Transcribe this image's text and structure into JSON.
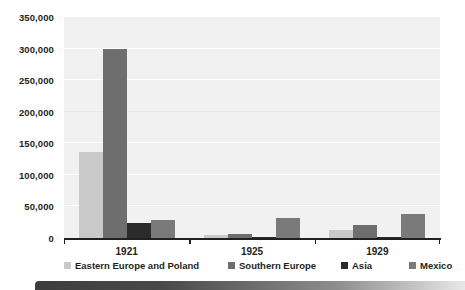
{
  "chart_data": {
    "type": "bar",
    "title": "",
    "subtitle": "",
    "xlabel": "",
    "ylabel": "",
    "categories": [
      "1921",
      "1925",
      "1929"
    ],
    "series": [
      {
        "name": "Eastern Europe and Poland",
        "color": "#c9c9c9",
        "values": [
          137000,
          4000,
          13000
        ]
      },
      {
        "name": "Southern Europe",
        "color": "#6e6e6e",
        "values": [
          300000,
          7000,
          20000
        ]
      },
      {
        "name": "Asia",
        "color": "#2b2b2b",
        "values": [
          24000,
          1000,
          1000
        ]
      },
      {
        "name": "Mexico",
        "color": "#7a7a7a",
        "values": [
          29000,
          31000,
          38000
        ]
      }
    ],
    "ylim": [
      0,
      350000
    ],
    "ytick_values": [
      0,
      50000,
      100000,
      150000,
      200000,
      250000,
      300000,
      350000
    ],
    "ytick_labels": [
      "0",
      "50,000",
      "100,000",
      "150,000",
      "200,000",
      "250,000",
      "300,000",
      "350,000"
    ],
    "grid": true,
    "grid_axis": "y",
    "legend_position": "bottom",
    "plot_background": "#f1f1f1",
    "axis_color": "#231f20"
  }
}
